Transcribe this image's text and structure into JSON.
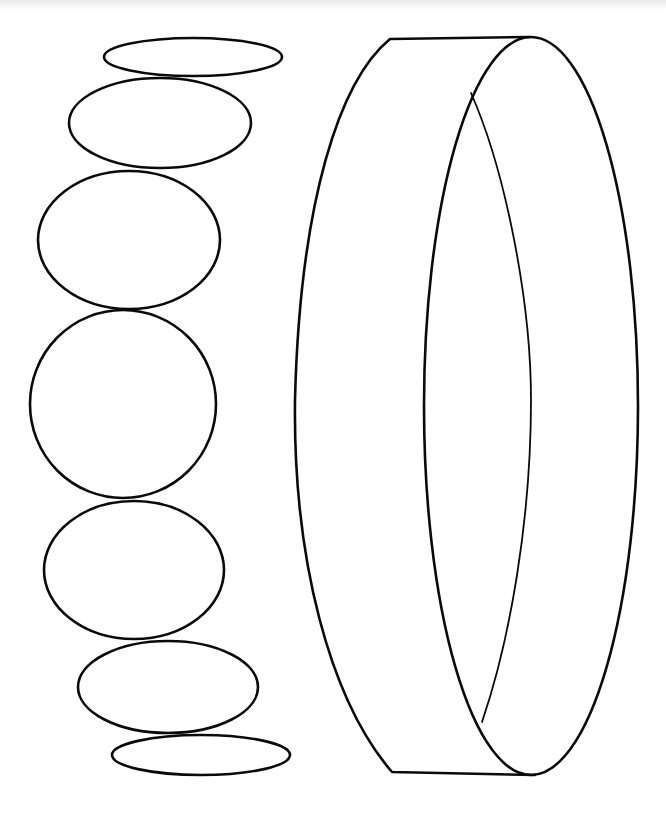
{
  "figure": {
    "background_color": "#ffffff",
    "stroke_color": "#0a0a0a",
    "ellipse_stack": [
      {
        "cx": 193,
        "cy": 57,
        "rx": 89,
        "ry": 19
      },
      {
        "cx": 160,
        "cy": 123,
        "rx": 91,
        "ry": 45
      },
      {
        "cx": 129,
        "cy": 240,
        "rx": 91,
        "ry": 69
      },
      {
        "cx": 123,
        "cy": 404,
        "rx": 93,
        "ry": 94
      },
      {
        "cx": 134,
        "cy": 570,
        "rx": 90,
        "ry": 69
      },
      {
        "cx": 168,
        "cy": 687,
        "rx": 90,
        "ry": 46
      },
      {
        "cx": 201,
        "cy": 755,
        "rx": 89,
        "ry": 20
      }
    ],
    "ring": {
      "label": "ring-band",
      "outer_back_edge_left_x": 293,
      "front_ellipse": {
        "cx": 531,
        "cy": 405,
        "rx": 107,
        "ry": 368
      },
      "top_y": 37,
      "bottom_y": 775
    }
  }
}
